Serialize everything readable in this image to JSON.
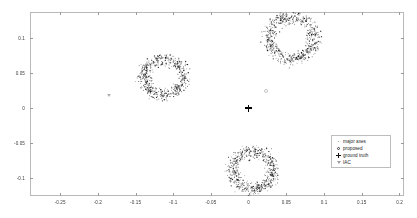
{
  "chart_data": {
    "type": "scatter",
    "title": "",
    "xlabel": "",
    "ylabel": "",
    "xlim": [
      -0.29,
      0.206
    ],
    "ylim": [
      -0.1255,
      0.1375
    ],
    "xticks": [
      -0.25,
      -0.2,
      -0.15,
      -0.1,
      -0.05,
      0,
      0.05,
      0.1,
      0.15,
      0.2
    ],
    "xticklabels": [
      "-0.25",
      "-0.2",
      "-0.15",
      "-0.1",
      "-0.05",
      "0",
      "0.05",
      "0.1",
      "0.15",
      "0.2"
    ],
    "yticks": [
      0.1,
      0.05,
      0,
      -0.05,
      -0.1
    ],
    "yticklabels": [
      "0.1",
      "0.05",
      "0",
      "-0.05",
      "-0.1"
    ],
    "grid": false,
    "legend_position": "lower-right",
    "legend": [
      {
        "marker": "dot-icon",
        "label": "major axes"
      },
      {
        "marker": "circle-icon",
        "label": "proposed"
      },
      {
        "marker": "plus-icon",
        "label": "ground truth"
      },
      {
        "marker": "triangle-down-icon",
        "label": "IAC"
      }
    ],
    "series": [
      {
        "name": "major axes",
        "marker": "dot",
        "color": "#1a1a1a",
        "description": "dense annular point clouds (scattered ring clusters)",
        "clusters": [
          {
            "name": "cluster-top-right",
            "cx": 0.0565,
            "cy": 0.1015,
            "r_inner": 0.0225,
            "r_outer": 0.0375,
            "n": 620
          },
          {
            "name": "cluster-mid-left",
            "cx": -0.1135,
            "cy": 0.0448,
            "r_inner": 0.0195,
            "r_outer": 0.033,
            "n": 560
          },
          {
            "name": "cluster-bottom",
            "cx": 0.0052,
            "cy": -0.0882,
            "r_inner": 0.02,
            "r_outer": 0.034,
            "n": 580
          }
        ]
      },
      {
        "name": "ground truth",
        "marker": "plus",
        "color": "#000000",
        "points": [
          {
            "x": 0.0,
            "y": 0.0
          }
        ]
      },
      {
        "name": "proposed",
        "marker": "circle",
        "color": "#c4c4c4",
        "points": [
          {
            "x": 0.0232,
            "y": 0.0248
          }
        ]
      },
      {
        "name": "IAC",
        "marker": "triangle-down",
        "color": "#b0b0b0",
        "points": [
          {
            "x": -0.1852,
            "y": 0.0172
          }
        ]
      }
    ]
  }
}
